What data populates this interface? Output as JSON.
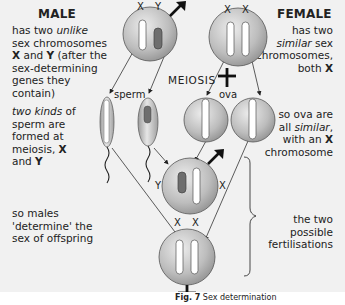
{
  "left_notes": {
    "male_heading": "MALE",
    "male_line1_pre": "has two ",
    "male_line1_em": "unlike",
    "male_line2": "sex chromosomes",
    "male_line3_b1": "X",
    "male_line3_mid": " and ",
    "male_line3_b2": "Y",
    "male_line3_post": " (after the",
    "male_line4": "sex-determining",
    "male_line5": "genes they",
    "male_line6": "contain)",
    "sperm_line1_em": "two kinds",
    "sperm_line1_post": " of",
    "sperm_line2": "sperm are",
    "sperm_line3": "formed at",
    "sperm_line4_pre": "meiosis, ",
    "sperm_line4_b": "X",
    "sperm_line5_pre": "and ",
    "sperm_line5_b": "Y",
    "males_line1": "so males",
    "males_line2": "'determine' the",
    "males_line3": "sex of offspring"
  },
  "right_notes": {
    "female_heading": "FEMALE",
    "female_line1": "has two",
    "female_line2_em": "similar",
    "female_line2_post": " sex",
    "female_line3": "chromosomes,",
    "female_line4_pre": "both ",
    "female_line4_b": "X",
    "ova_line1": "so ova are",
    "ova_line2_pre": "all ",
    "ova_line2_em": "similar",
    "ova_line2_post": ",",
    "ova_line3_pre": "with an ",
    "ova_line3_b": "X",
    "ova_line4": "chromosome",
    "fert_line1": "the two",
    "fert_line2": "possible",
    "fert_line3": "fertilisations"
  },
  "diagram": {
    "meiosis_label": "MEIOSIS",
    "sperm_label": "sperm",
    "ova_label": "ova",
    "male_parent": {
      "chrom_left": "X",
      "chrom_right": "Y",
      "symbol": "male-symbol"
    },
    "female_parent": {
      "chrom_left": "X",
      "chrom_right": "X",
      "symbol": "female-symbol"
    },
    "male_offspring": {
      "chrom_left": "Y",
      "chrom_right": "X",
      "symbol": "male-symbol"
    },
    "female_offspring": {
      "chrom_left": "X",
      "chrom_right": "X",
      "symbol": "female-symbol"
    },
    "colors": {
      "cell_light": "#e4e4e4",
      "cell_dark": "#8c8c8c",
      "y_chromosome": "#6e6e6e",
      "x_chromosome": "#ffffff",
      "panel_bg": "#f1f1f1"
    }
  },
  "caption": {
    "fig": "Fig. 7",
    "title": " Sex determination"
  }
}
